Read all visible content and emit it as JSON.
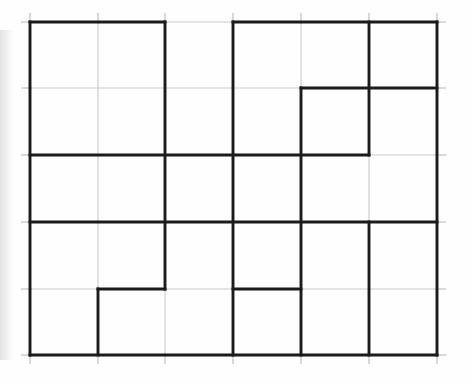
{
  "document": {
    "title": "Hand-drawn grid partition puzzle",
    "description": "A 6 column by 5 row faint grid with heavy hand-drawn lines marking rectangular regions",
    "background_color": "#fefefe"
  },
  "grid": {
    "columns": 6,
    "rows": 5,
    "cell_width": 67.8,
    "cell_height": 66.6,
    "origin_x": 30,
    "origin_y": 22,
    "x_positions": [
      30,
      98,
      165,
      233,
      301,
      369,
      437
    ],
    "y_positions": [
      22,
      88,
      155,
      222,
      289,
      355
    ],
    "faint_line_color": "#c9c9c9",
    "faint_line_width": 1.1,
    "heavy_line_color": "#1b1b1b",
    "heavy_line_width": 2.9,
    "tick_color": "#b8b8b8",
    "tick_length": 9
  },
  "heavy_segments": {
    "horizontal": [
      {
        "name": "top-border-c1",
        "row_y_index": 0,
        "from_x_index": 0,
        "to_x_index": 2
      },
      {
        "name": "top-border-c4",
        "row_y_index": 0,
        "from_x_index": 3,
        "to_x_index": 6
      },
      {
        "name": "row1-right",
        "row_y_index": 1,
        "from_x_index": 4,
        "to_x_index": 6
      },
      {
        "name": "row2-left",
        "row_y_index": 2,
        "from_x_index": 0,
        "to_x_index": 5
      },
      {
        "name": "row3-full",
        "row_y_index": 3,
        "from_x_index": 0,
        "to_x_index": 6
      },
      {
        "name": "row4-seg-b",
        "row_y_index": 4,
        "from_x_index": 1,
        "to_x_index": 2
      },
      {
        "name": "row4-seg-d",
        "row_y_index": 4,
        "from_x_index": 3,
        "to_x_index": 4
      },
      {
        "name": "bottom-border",
        "row_y_index": 5,
        "from_x_index": 0,
        "to_x_index": 6
      }
    ],
    "vertical": [
      {
        "name": "left-border",
        "col_x_index": 0,
        "from_y_index": 0,
        "to_y_index": 5
      },
      {
        "name": "col1-bottom",
        "col_x_index": 1,
        "from_y_index": 4,
        "to_y_index": 5
      },
      {
        "name": "col2-upper",
        "col_x_index": 2,
        "from_y_index": 0,
        "to_y_index": 4
      },
      {
        "name": "col3-full",
        "col_x_index": 3,
        "from_y_index": 0,
        "to_y_index": 5
      },
      {
        "name": "col4-lower",
        "col_x_index": 4,
        "from_y_index": 1,
        "to_y_index": 5
      },
      {
        "name": "col5-upper",
        "col_x_index": 5,
        "from_y_index": 0,
        "to_y_index": 2
      },
      {
        "name": "col5-lower",
        "col_x_index": 5,
        "from_y_index": 3,
        "to_y_index": 5
      },
      {
        "name": "right-border",
        "col_x_index": 6,
        "from_y_index": 0,
        "to_y_index": 5
      }
    ]
  }
}
